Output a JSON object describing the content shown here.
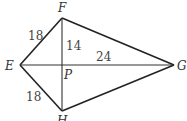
{
  "diagram": {
    "type": "kite",
    "vertices": {
      "F": {
        "label": "F",
        "x": 62,
        "y": 18
      },
      "E": {
        "label": "E",
        "x": 20,
        "y": 65
      },
      "H": {
        "label": "H",
        "x": 62,
        "y": 111
      },
      "G": {
        "label": "G",
        "x": 174,
        "y": 65
      },
      "P": {
        "label": "P",
        "x": 62,
        "y": 65
      }
    },
    "measurements": {
      "EF": "18",
      "EH": "18",
      "FP": "14",
      "PG": "24"
    },
    "colors": {
      "stroke": "#222222",
      "text": "#333333",
      "background": "#ffffff"
    }
  }
}
